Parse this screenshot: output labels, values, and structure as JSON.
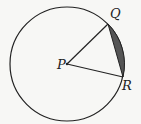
{
  "diagram": {
    "type": "circle-sector-segment",
    "circle": {
      "cx": 67,
      "cy": 64,
      "r": 57
    },
    "points": {
      "P": {
        "label": "P",
        "x": 67,
        "y": 64
      },
      "Q": {
        "label": "Q",
        "x": 108,
        "y": 24
      },
      "R": {
        "label": "R",
        "x": 123,
        "y": 77
      }
    },
    "shaded_region": "segment between chord QR and minor arc QR",
    "colors": {
      "stroke": "#222222",
      "shade": "#555555",
      "background": "#f7f7f5"
    }
  }
}
